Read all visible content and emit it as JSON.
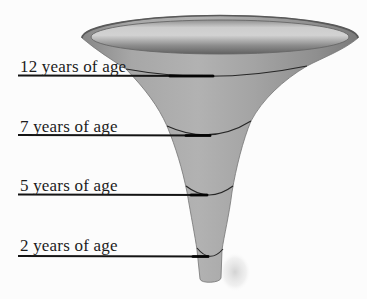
{
  "diagram": {
    "type": "funnel-illustration",
    "stages": [
      {
        "label": "12 years of age"
      },
      {
        "label": "7 years of age"
      },
      {
        "label": "5 years of age"
      },
      {
        "label": "2 years of age"
      }
    ],
    "colors": {
      "background": "#fcfcfc",
      "funnel_body": "#a2a2a2",
      "funnel_highlight": "#b8b8b8",
      "funnel_shadow": "#7d7d7d",
      "bowl_light": "#d2d2d2",
      "bowl_dark": "#616161",
      "ring_line": "#262626",
      "leader_line": "#141414",
      "label_text": "#1c1c1c"
    }
  }
}
